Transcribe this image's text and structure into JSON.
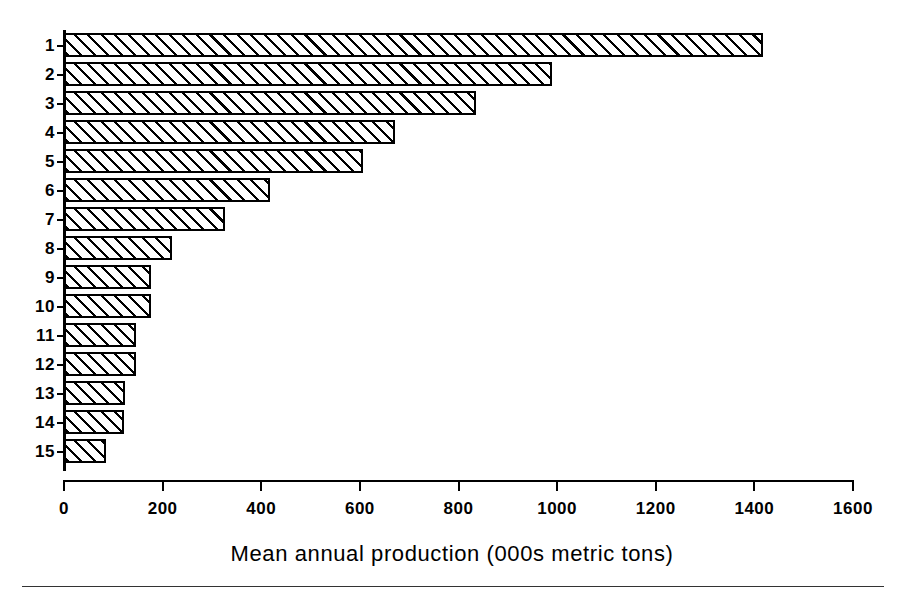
{
  "chart_data": {
    "type": "bar",
    "orientation": "horizontal",
    "title": "",
    "subtitle": "",
    "xlabel": "Mean annual production (000s metric tons)",
    "ylabel": "",
    "xlim": [
      0,
      1600
    ],
    "xticks": [
      0,
      200,
      400,
      600,
      800,
      1000,
      1200,
      1400,
      1600
    ],
    "xtick_labels": [
      "0",
      "200",
      "400",
      "600",
      "800",
      "1000",
      "1200",
      "1400",
      "1600"
    ],
    "grid": false,
    "legend": null,
    "legend_position": "none",
    "categories": [
      "1",
      "2",
      "3",
      "4",
      "5",
      "6",
      "7",
      "8",
      "9",
      "10",
      "11",
      "12",
      "13",
      "14",
      "15"
    ],
    "values": [
      1418,
      990,
      836,
      671,
      606,
      418,
      327,
      219,
      177,
      176,
      146,
      146,
      124,
      122,
      85
    ],
    "bar_fill": "diagonal-hatch",
    "bar_edge_color": "#000000",
    "bar_face_color": "#ffffff"
  },
  "figure": {
    "axis_title": "Mean annual production (000s metric tons)",
    "x_tick_labels": [
      "0",
      "200",
      "400",
      "600",
      "800",
      "1000",
      "1200",
      "1400",
      "1600"
    ],
    "y_tick_labels": [
      "1",
      "2",
      "3",
      "4",
      "5",
      "6",
      "7",
      "8",
      "9",
      "10",
      "11",
      "12",
      "13",
      "14",
      "15"
    ],
    "colors": {
      "ink": "#000000",
      "paper": "#ffffff",
      "rule": "#333333"
    }
  }
}
